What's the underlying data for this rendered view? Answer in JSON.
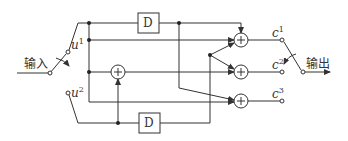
{
  "diagram": {
    "input_label": "输入",
    "output_label": "输出",
    "input_terminals": [
      {
        "name": "u",
        "sup": "1"
      },
      {
        "name": "u",
        "sup": "2"
      }
    ],
    "output_terminals": [
      {
        "name": "c",
        "sup": "1"
      },
      {
        "name": "c",
        "sup": "2"
      },
      {
        "name": "c",
        "sup": "3"
      }
    ],
    "delay_blocks": [
      {
        "label": "D"
      },
      {
        "label": "D"
      }
    ],
    "adder_symbol": "+",
    "colors": {
      "stroke": "#333333",
      "background": "#ffffff"
    }
  }
}
